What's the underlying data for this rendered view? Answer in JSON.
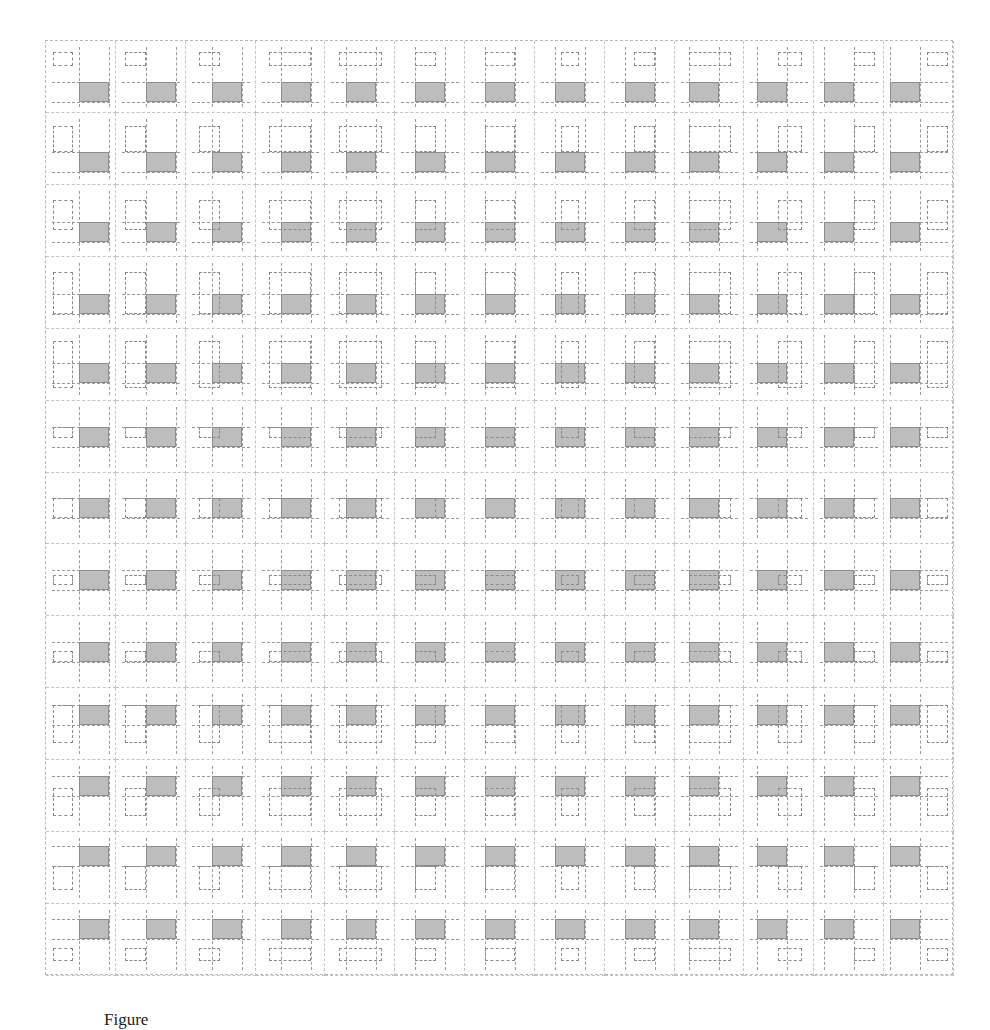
{
  "figure": {
    "rows": 13,
    "cols": 13,
    "colors": {
      "reference_fill": "#bdbdbd",
      "reference_border": "#8c8c8c",
      "moving_border": "#8a8a8a",
      "guide_lines": "#9a9a9a",
      "cell_border": "#c4c4c4"
    },
    "x_relations": [
      {
        "name": "before",
        "interval": [
          -0.85,
          -0.2
        ]
      },
      {
        "name": "meets",
        "interval": [
          -0.7,
          0.0
        ]
      },
      {
        "name": "overlaps",
        "interval": [
          -0.45,
          0.25
        ]
      },
      {
        "name": "finished-by",
        "interval": [
          -0.4,
          1.0
        ]
      },
      {
        "name": "contains",
        "interval": [
          -0.25,
          1.2
        ]
      },
      {
        "name": "starts",
        "interval": [
          0.0,
          0.7
        ]
      },
      {
        "name": "equals",
        "interval": [
          0.0,
          1.0
        ]
      },
      {
        "name": "during",
        "interval": [
          0.2,
          0.8
        ]
      },
      {
        "name": "finishes",
        "interval": [
          0.3,
          1.0
        ]
      },
      {
        "name": "started-by",
        "interval": [
          0.0,
          1.4
        ]
      },
      {
        "name": "overlapped-by",
        "interval": [
          0.7,
          1.5
        ]
      },
      {
        "name": "met-by",
        "interval": [
          1.0,
          1.7
        ]
      },
      {
        "name": "after",
        "interval": [
          1.25,
          1.95
        ]
      }
    ],
    "y_relations": [
      {
        "name": "before",
        "interval": [
          -1.5,
          -0.8
        ]
      },
      {
        "name": "meets",
        "interval": [
          -1.3,
          0.0
        ]
      },
      {
        "name": "overlaps",
        "interval": [
          -1.1,
          0.4
        ]
      },
      {
        "name": "finished-by",
        "interval": [
          -1.1,
          1.0
        ]
      },
      {
        "name": "contains",
        "interval": [
          -1.1,
          1.25
        ]
      },
      {
        "name": "starts",
        "interval": [
          0.0,
          0.55
        ]
      },
      {
        "name": "equals",
        "interval": [
          0.0,
          1.0
        ]
      },
      {
        "name": "during",
        "interval": [
          0.25,
          0.75
        ]
      },
      {
        "name": "finishes",
        "interval": [
          0.45,
          1.0
        ]
      },
      {
        "name": "started-by",
        "interval": [
          0.0,
          1.9
        ]
      },
      {
        "name": "overlapped-by",
        "interval": [
          0.6,
          2.0
        ]
      },
      {
        "name": "met-by",
        "interval": [
          1.0,
          2.2
        ]
      },
      {
        "name": "after",
        "interval": [
          1.45,
          2.1
        ]
      }
    ]
  },
  "caption": "Figure"
}
